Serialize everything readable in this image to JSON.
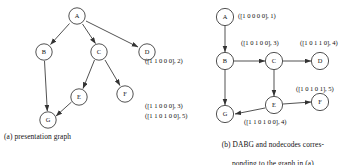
{
  "figure": {
    "panels": [
      {
        "id": "a",
        "caption": "(a) presentation graph",
        "nodes": [
          {
            "id": "A",
            "label": "A",
            "cx": 77,
            "cy": 16
          },
          {
            "id": "B",
            "label": "B",
            "cx": 44,
            "cy": 52
          },
          {
            "id": "C",
            "label": "C",
            "cx": 99,
            "cy": 52
          },
          {
            "id": "D",
            "label": "D",
            "cx": 147,
            "cy": 52
          },
          {
            "id": "E",
            "label": "E",
            "cx": 79,
            "cy": 97
          },
          {
            "id": "F",
            "label": "F",
            "cx": 125,
            "cy": 94
          },
          {
            "id": "G",
            "label": "G",
            "cx": 48,
            "cy": 120
          }
        ],
        "edges": [
          {
            "from": "A",
            "to": "B"
          },
          {
            "from": "A",
            "to": "C"
          },
          {
            "from": "A",
            "to": "D"
          },
          {
            "from": "B",
            "to": "G"
          },
          {
            "from": "C",
            "to": "E"
          },
          {
            "from": "C",
            "to": "F"
          },
          {
            "from": "E",
            "to": "G"
          }
        ]
      },
      {
        "id": "b",
        "caption_line1": "(b) DABG and nodecodes corres-",
        "caption_line2": "ponding to the graph in (a)",
        "nodes": [
          {
            "id": "A",
            "label": "A",
            "cx": 47,
            "cy": 17
          },
          {
            "id": "B",
            "label": "B",
            "cx": 47,
            "cy": 61
          },
          {
            "id": "C",
            "label": "C",
            "cx": 96,
            "cy": 61
          },
          {
            "id": "D",
            "label": "D",
            "cx": 142,
            "cy": 61
          },
          {
            "id": "E",
            "label": "E",
            "cx": 96,
            "cy": 105
          },
          {
            "id": "F",
            "label": "F",
            "cx": 142,
            "cy": 102
          },
          {
            "id": "G",
            "label": "G",
            "cx": 47,
            "cy": 114
          }
        ],
        "edges": [
          {
            "from": "A",
            "to": "B"
          },
          {
            "from": "B",
            "to": "C"
          },
          {
            "from": "C",
            "to": "D"
          },
          {
            "from": "B",
            "to": "G"
          },
          {
            "from": "C",
            "to": "E"
          },
          {
            "from": "E",
            "to": "F"
          },
          {
            "from": "E",
            "to": "G"
          }
        ],
        "nodecodes": [
          {
            "node": "A",
            "text": "([1 0 0 0 0], 1)"
          },
          {
            "node": "B",
            "text": "([1 1 0 0 0], 2)"
          },
          {
            "node": "C",
            "text": "([1 0 1 0 0], 3)"
          },
          {
            "node": "D",
            "text": "([1 0 1 1 0], 4)"
          },
          {
            "node": "E",
            "text": "([1 1 0 1 0 0], 4)"
          },
          {
            "node": "F",
            "text": "([1 0 1 0 1], 5)"
          },
          {
            "node": "G1",
            "text": "([1 1 0 0 0], 3)"
          },
          {
            "node": "G2",
            "text": "([1 1 0 1 0 0], 5)"
          }
        ]
      }
    ],
    "colors": {
      "stroke": "#333333",
      "text": "#111111",
      "background": "#ffffff"
    }
  }
}
